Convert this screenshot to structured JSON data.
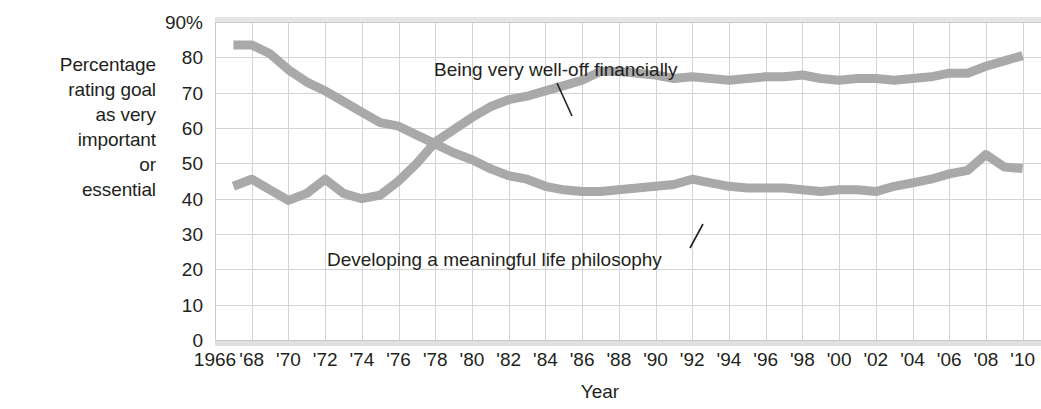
{
  "axis_label_left": {
    "lines": [
      "Percentage",
      "rating goal",
      "as very",
      "important",
      "or",
      "essential"
    ]
  },
  "chart_data": {
    "type": "line",
    "title": "",
    "xlabel": "Year",
    "ylabel": "Percentage rating goal as very important or essential",
    "ylim": [
      0,
      90
    ],
    "yticks": [
      0,
      10,
      20,
      30,
      40,
      50,
      60,
      70,
      80,
      90
    ],
    "ytick_labels": [
      "0",
      "10",
      "20",
      "30",
      "40",
      "50",
      "60",
      "70",
      "80",
      "90%"
    ],
    "xlim": [
      1966,
      2011
    ],
    "xticks": [
      1966,
      1968,
      1970,
      1972,
      1974,
      1976,
      1978,
      1980,
      1982,
      1984,
      1986,
      1988,
      1990,
      1992,
      1994,
      1996,
      1998,
      2000,
      2002,
      2004,
      2006,
      2008,
      2010
    ],
    "xtick_labels": [
      "1966",
      "'68",
      "'70",
      "'72",
      "'74",
      "'76",
      "'78",
      "'80",
      "'82",
      "'84",
      "'86",
      "'88",
      "'90",
      "'92",
      "'94",
      "'96",
      "'98",
      "'00",
      "'02",
      "'04",
      "'06",
      "'08",
      "'10"
    ],
    "grid": true,
    "legend_position": "inline-annotation",
    "line_color": "#a9a9a9",
    "series": [
      {
        "name": "Being very well-off financially",
        "x": [
          1967,
          1968,
          1969,
          1970,
          1971,
          1972,
          1973,
          1974,
          1975,
          1976,
          1977,
          1978,
          1979,
          1980,
          1981,
          1982,
          1983,
          1984,
          1985,
          1986,
          1987,
          1988,
          1989,
          1990,
          1991,
          1992,
          1993,
          1994,
          1995,
          1996,
          1997,
          1998,
          1999,
          2000,
          2001,
          2002,
          2003,
          2004,
          2005,
          2006,
          2007,
          2008,
          2009,
          2010
        ],
        "values": [
          43.5,
          45.5,
          42.5,
          39.5,
          41.5,
          45.5,
          41.5,
          40,
          41,
          45,
          50,
          56,
          59.5,
          63,
          66,
          68,
          69,
          70.5,
          72,
          73.5,
          76,
          76,
          75.5,
          75,
          74,
          74.5,
          74,
          73.5,
          74,
          74.5,
          74.5,
          75,
          74,
          73.5,
          74,
          74,
          73.5,
          74,
          74.5,
          75.5,
          75.5,
          77.5,
          79,
          80.5
        ],
        "annotation": "Being very well-off financially"
      },
      {
        "name": "Developing a meaningful life philosophy",
        "x": [
          1967,
          1968,
          1969,
          1970,
          1971,
          1972,
          1973,
          1974,
          1975,
          1976,
          1977,
          1978,
          1979,
          1980,
          1981,
          1982,
          1983,
          1984,
          1985,
          1986,
          1987,
          1988,
          1989,
          1990,
          1991,
          1992,
          1993,
          1994,
          1995,
          1996,
          1997,
          1998,
          1999,
          2000,
          2001,
          2002,
          2003,
          2004,
          2005,
          2006,
          2007,
          2008,
          2009,
          2010
        ],
        "values": [
          83.5,
          83.5,
          81,
          76.5,
          73,
          70.5,
          67.5,
          64.5,
          61.5,
          60.5,
          58,
          55.5,
          53,
          51,
          48.5,
          46.5,
          45.5,
          43.5,
          42.5,
          42,
          42,
          42.5,
          43,
          43.5,
          44,
          45.5,
          44.5,
          43.5,
          43,
          43,
          43,
          42.5,
          42,
          42.5,
          42.5,
          42,
          43.5,
          44.5,
          45.5,
          47,
          48,
          52.5,
          49,
          48.5
        ],
        "annotation": "Developing a meaningful life philosophy"
      }
    ]
  }
}
